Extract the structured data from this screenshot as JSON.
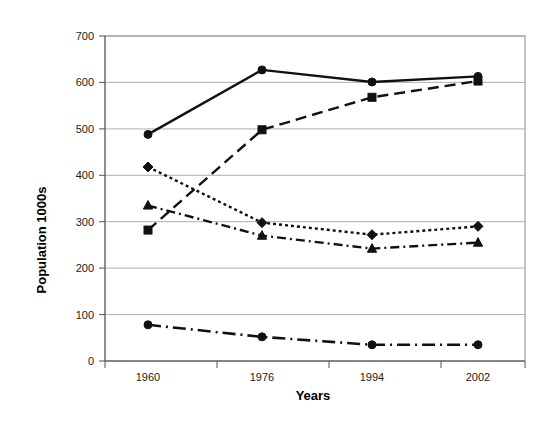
{
  "chart_data": {
    "type": "line",
    "title": "",
    "xlabel": "Years",
    "ylabel": "Population 1000s",
    "categories": [
      "1960",
      "1976",
      "1994",
      "2002"
    ],
    "x": [
      1960,
      1976,
      1994,
      2002
    ],
    "ylim": [
      0,
      700
    ],
    "ytick_labels": [
      "0",
      "100",
      "200",
      "300",
      "400",
      "500",
      "600",
      "700"
    ],
    "ytick_values": [
      0,
      100,
      200,
      300,
      400,
      500,
      600,
      700
    ],
    "grid": true,
    "legend": "none",
    "series": [
      {
        "name": "series-1",
        "values": [
          488,
          627,
          601,
          613
        ],
        "line_style": "solid",
        "marker": "circle",
        "color": "#111111"
      },
      {
        "name": "series-2",
        "values": [
          282,
          498,
          568,
          603
        ],
        "line_style": "dashed",
        "marker": "square",
        "color": "#111111"
      },
      {
        "name": "series-3",
        "values": [
          418,
          298,
          272,
          290
        ],
        "line_style": "dotted",
        "marker": "diamond",
        "color": "#111111"
      },
      {
        "name": "series-4",
        "values": [
          335,
          270,
          242,
          255
        ],
        "line_style": "dashdot",
        "marker": "triangle",
        "color": "#111111"
      },
      {
        "name": "series-5",
        "values": [
          78,
          52,
          35,
          35
        ],
        "line_style": "longdashdot",
        "marker": "circle",
        "color": "#111111"
      }
    ]
  },
  "axes": {
    "y_title": "Population 1000s",
    "x_title": "Years",
    "y_ticks": [
      "700",
      "600",
      "500",
      "400",
      "300",
      "200",
      "100",
      "0"
    ],
    "x_ticks": [
      "1960",
      "1976",
      "1994",
      "2002"
    ]
  },
  "colors": {
    "ink": "#111111",
    "grid": "#9a9a9a",
    "frame": "#8d8d8d",
    "background": "#ffffff"
  }
}
